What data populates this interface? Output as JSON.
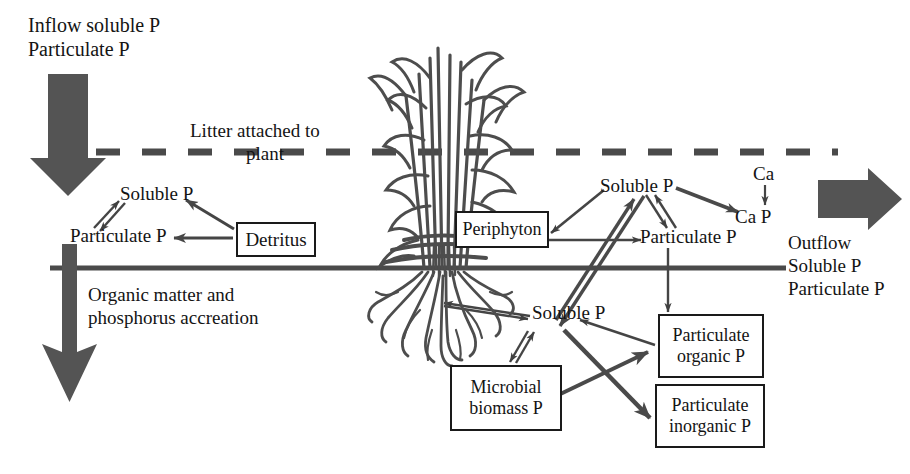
{
  "figure": {
    "kind": "wetland-phosphorus-cycling-schematic",
    "accent_dark": "#4a4a4a",
    "line_color": "#404040",
    "text_color": "#141414",
    "plant_color": "#4d4d4d"
  },
  "inflow": {
    "line1": "Inflow soluble P",
    "line2": "Particulate P",
    "arrow_name": "inflow-arrow"
  },
  "outflow": {
    "line1": "Outflow",
    "line2": "Soluble P",
    "line3": "Particulate P",
    "arrow_name": "outflow-arrow"
  },
  "water_surface": {
    "label_line1": "Litter attached to",
    "label_line2": "plant",
    "style": "dashed"
  },
  "accretion": {
    "line1": "Organic matter and",
    "line2": "phosphorus accreation",
    "arrow_name": "accretion-arrow"
  },
  "left_pool": {
    "soluble": "Soluble P",
    "particulate": "Particulate P",
    "detritus": "Detritus"
  },
  "right_water_column": {
    "soluble": "Soluble P",
    "particulate": "Particulate P",
    "ca": "Ca",
    "ca_p": "Ca P"
  },
  "periphyton": {
    "label": "Periphyton"
  },
  "soil_pools": {
    "soluble": "Soluble P",
    "microbial_line1": "Microbial",
    "microbial_line2": "biomass P",
    "part_org_line1": "Particulate",
    "part_org_line2": "organic P",
    "part_inorg_line1": "Particulate",
    "part_inorg_line2": "inorganic P"
  }
}
